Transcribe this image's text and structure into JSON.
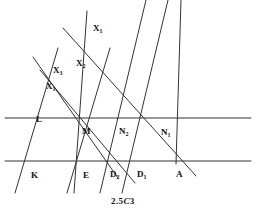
{
  "figure": {
    "caption": "2.5C3",
    "caption_prefix": "2.5",
    "caption_letter": "C",
    "caption_suffix": "3",
    "stroke_color": "#333333",
    "background_color": "#ffffff",
    "line_width": 1.0
  },
  "labels": [
    {
      "id": "X1-top",
      "base": "X",
      "sub": "1",
      "x": 93,
      "y": 24
    },
    {
      "id": "X2-mid",
      "base": "X",
      "sub": "2",
      "x": 76,
      "y": 59
    },
    {
      "id": "X3-mid",
      "base": "X",
      "sub": "3",
      "x": 53,
      "y": 66
    },
    {
      "id": "X1-left",
      "base": "X",
      "sub": "1",
      "x": 46,
      "y": 82
    },
    {
      "id": "L",
      "base": "L",
      "sub": "",
      "x": 36,
      "y": 115
    },
    {
      "id": "M",
      "base": "M",
      "sub": "",
      "x": 82,
      "y": 127
    },
    {
      "id": "N2",
      "base": "N",
      "sub": "2",
      "x": 119,
      "y": 127
    },
    {
      "id": "N1",
      "base": "N",
      "sub": "1",
      "x": 161,
      "y": 128
    },
    {
      "id": "K",
      "base": "K",
      "sub": "",
      "x": 31,
      "y": 171
    },
    {
      "id": "E",
      "base": "E",
      "sub": "",
      "x": 83,
      "y": 171
    },
    {
      "id": "D2",
      "base": "D",
      "sub": "2",
      "x": 110,
      "y": 170
    },
    {
      "id": "D1",
      "base": "D",
      "sub": "1",
      "x": 137,
      "y": 170
    },
    {
      "id": "A",
      "base": "A",
      "sub": "",
      "x": 176,
      "y": 170
    }
  ],
  "lines": [
    {
      "id": "horizontal-line-upper",
      "role": "parallel-line-through-L-M-N2-N1",
      "x1": 5,
      "y1": 118,
      "x2": 251,
      "y2": 118
    },
    {
      "id": "horizontal-line-lower",
      "role": "parallel-line-through-K-E-D2-D1-A",
      "x1": 5,
      "y1": 161,
      "x2": 251,
      "y2": 161
    },
    {
      "id": "transversal-1",
      "role": "parallel-transversal-through-K",
      "x1": 15,
      "y1": 193,
      "x2": 58,
      "y2": 48
    },
    {
      "id": "transversal-2",
      "role": "parallel-transversal-through-E",
      "x1": 67,
      "y1": 193,
      "x2": 110,
      "y2": 48
    },
    {
      "id": "transversal-3",
      "role": "parallel-transversal-through-D2",
      "x1": 100,
      "y1": 193,
      "x2": 146,
      "y2": 0
    },
    {
      "id": "transversal-4",
      "role": "parallel-transversal-through-D1",
      "x1": 122,
      "y1": 193,
      "x2": 168,
      "y2": 0
    },
    {
      "id": "ray-M-X1",
      "role": "line-through-M-to-X1",
      "x1": 87,
      "y1": 11,
      "x2": 74,
      "y2": 193
    },
    {
      "id": "ray-M-X3",
      "role": "line-through-M-to-X3",
      "x1": 33,
      "y1": 57,
      "x2": 118,
      "y2": 178
    },
    {
      "id": "ray-M-X2",
      "role": "line-through-M-to-X2",
      "x1": 40,
      "y1": 70,
      "x2": 135,
      "y2": 183
    },
    {
      "id": "ray-A-X1",
      "role": "line-from-A-through-X1-upper",
      "x1": 63,
      "y1": 28,
      "x2": 196,
      "y2": 176
    },
    {
      "id": "ray-A-N1",
      "role": "line-from-A-through-N1",
      "x1": 181,
      "y1": 0,
      "x2": 176,
      "y2": 164
    }
  ]
}
